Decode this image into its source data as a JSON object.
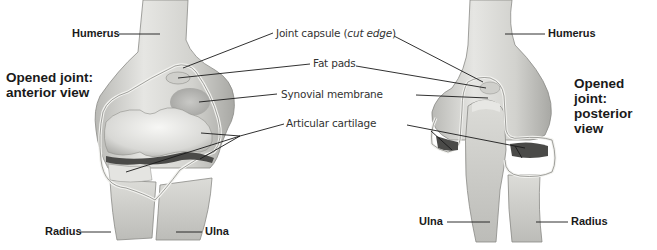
{
  "figure": {
    "background": "#ffffff",
    "line_color": "#1a1a1a",
    "bone_color": "#d9d9d6",
    "bone_shadow": "#9a9a96",
    "cartilage_color": "#ececea",
    "cavity_color": "#4a4a48"
  },
  "anterior": {
    "title_line1": "Opened joint:",
    "title_line2": "anterior view",
    "labels": {
      "humerus": "Humerus",
      "radius": "Radius",
      "ulna": "Ulna"
    }
  },
  "posterior": {
    "title_line1": "Opened joint:",
    "title_line2": "posterior view",
    "labels": {
      "humerus": "Humerus",
      "ulna": "Ulna",
      "radius": "Radius"
    }
  },
  "shared_labels": {
    "joint_capsule_prefix": "Joint capsule (",
    "joint_capsule_italic": "cut edge",
    "joint_capsule_suffix": ")",
    "fat_pads": "Fat pads",
    "synovial_membrane": "Synovial membrane",
    "articular_cartilage": "Articular cartilage"
  }
}
